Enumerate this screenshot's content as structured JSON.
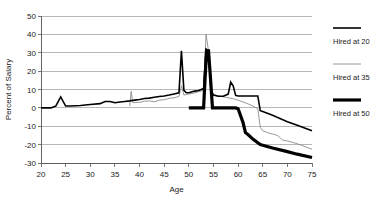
{
  "chart_data": {
    "type": "line",
    "title": "",
    "xlabel": "Age",
    "ylabel": "Percent of Salary",
    "xlim": [
      20,
      75
    ],
    "ylim": [
      -30,
      50
    ],
    "xticks": [
      20,
      25,
      30,
      35,
      40,
      45,
      50,
      55,
      60,
      65,
      70,
      75
    ],
    "yticks": [
      -30,
      -20,
      -10,
      0,
      10,
      20,
      30,
      40,
      50
    ],
    "xtick_labels": [
      "20",
      "25",
      "30",
      "35",
      "40",
      "45",
      "50",
      "55",
      "60",
      "65",
      "70",
      "75"
    ],
    "ytick_labels": [
      "-30",
      "-20",
      "-10",
      "0",
      "10",
      "20",
      "30",
      "40",
      "50"
    ],
    "grid": true,
    "legend_position": "right",
    "series": [
      {
        "name": "Hired at 20",
        "color": "#000000",
        "width": 1.6,
        "x": [
          20,
          22,
          23,
          24,
          25,
          26,
          28,
          30,
          32,
          33,
          34,
          35,
          36,
          37,
          38,
          39,
          40,
          41,
          42,
          43,
          44,
          45,
          46,
          47,
          48,
          48.5,
          49,
          49.5,
          50,
          51,
          52,
          53,
          53.5,
          54,
          54.5,
          55,
          56,
          57,
          58,
          58.5,
          59,
          59.5,
          60,
          61,
          62,
          63,
          64,
          64.5,
          65,
          67,
          70,
          72,
          75
        ],
        "y": [
          0,
          0,
          1,
          6,
          1,
          1,
          1.3,
          1.8,
          2.3,
          3.5,
          3.5,
          2.8,
          3.2,
          3.5,
          3.8,
          4.2,
          4.6,
          5.1,
          5.3,
          5.8,
          6.2,
          6.5,
          7.0,
          7.6,
          8.2,
          31,
          9.5,
          8.2,
          8.2,
          9.0,
          9.5,
          10.5,
          32,
          31,
          9.5,
          7.0,
          6.3,
          6.3,
          7.5,
          14,
          12,
          6.8,
          6.5,
          6.5,
          6.5,
          6.5,
          6.5,
          -1.5,
          -2.0,
          -4.0,
          -7.5,
          -9.5,
          -12.5
        ]
      },
      {
        "name": "Hired at 35",
        "color": "#8c8c8c",
        "width": 0.9,
        "x": [
          38,
          38.3,
          38.6,
          39,
          39.5,
          40,
          41,
          42,
          43,
          44,
          45,
          46,
          47,
          48,
          48.5,
          49,
          49.5,
          50,
          51,
          52,
          53,
          53.5,
          54,
          54.5,
          55,
          56,
          57,
          58,
          59,
          60,
          61,
          62,
          63,
          64,
          64.5,
          65,
          66,
          67,
          68,
          69,
          70,
          72,
          75
        ],
        "y": [
          1.0,
          9.0,
          3.0,
          2.8,
          3.0,
          3.0,
          3.6,
          3.8,
          3.3,
          4.2,
          4.4,
          5.2,
          5.5,
          6.2,
          12.0,
          7.0,
          7.2,
          7.5,
          8.0,
          8.8,
          9.5,
          40,
          31,
          9.0,
          7.2,
          6.5,
          6.0,
          5.5,
          5.0,
          4.2,
          3.2,
          2.2,
          1.0,
          -0.5,
          -10.5,
          -12.5,
          -13.5,
          -14.2,
          -15.0,
          -17.5,
          -18.0,
          -19.5,
          -22.5
        ]
      },
      {
        "name": "Hired at 50",
        "color": "#000000",
        "width": 3.2,
        "x": [
          50,
          51,
          52,
          53,
          53.3,
          53.6,
          54,
          54.4,
          54.8,
          55,
          56,
          57,
          58,
          58.5,
          59,
          59.5,
          60,
          61,
          61.5,
          62,
          63,
          64,
          64.5,
          65,
          67,
          70,
          72,
          75
        ],
        "y": [
          0,
          0,
          0,
          0,
          16,
          31,
          31,
          16,
          0,
          0,
          0,
          0,
          0,
          0,
          0,
          0,
          -0.5,
          -8.0,
          -13.5,
          -14.5,
          -17.0,
          -19.0,
          -20.0,
          -20.3,
          -21.8,
          -23.8,
          -25.2,
          -27.0
        ]
      }
    ]
  },
  "legend": {
    "items": [
      {
        "label": "Hired at 20"
      },
      {
        "label": "Hired at 35"
      },
      {
        "label": "Hired at 50"
      }
    ]
  }
}
